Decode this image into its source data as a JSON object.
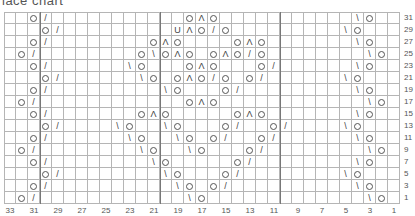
{
  "title": "lace chart",
  "chart_data": {
    "type": "table",
    "title": "lace chart",
    "columns": 33,
    "rows_shown": [
      31,
      29,
      27,
      25,
      23,
      21,
      19,
      17,
      15,
      13,
      11,
      9,
      7,
      5,
      3,
      1
    ],
    "column_labels": [
      "33",
      "31",
      "29",
      "27",
      "25",
      "23",
      "21",
      "19",
      "17",
      "15",
      "13",
      "11",
      "9",
      "7",
      "5",
      "3",
      "1"
    ],
    "row_labels": [
      "31",
      "29",
      "27",
      "25",
      "23",
      "21",
      "19",
      "17",
      "15",
      "13",
      "11",
      "9",
      "7",
      "5",
      "3",
      "1"
    ],
    "legend_symbols": {
      "O": "yarn over",
      "/": "k2tog",
      "\\": "ssk",
      "Λ": "centered double decrease",
      "U": "special stitch"
    },
    "repeat_lines_x": [
      40,
      160,
      280
    ],
    "grid": [
      {
        "row": 31,
        "cells": [
          [
            2,
            "O"
          ],
          [
            3,
            "/"
          ],
          [
            15,
            "O"
          ],
          [
            16,
            "Λ"
          ],
          [
            17,
            "O"
          ],
          [
            29,
            "\\"
          ],
          [
            30,
            "O"
          ]
        ]
      },
      {
        "row": 29,
        "cells": [
          [
            3,
            "O"
          ],
          [
            4,
            "/"
          ],
          [
            14,
            "U"
          ],
          [
            15,
            "Λ"
          ],
          [
            16,
            "O"
          ],
          [
            17,
            "/"
          ],
          [
            18,
            "O"
          ],
          [
            28,
            "\\"
          ],
          [
            29,
            "O"
          ]
        ]
      },
      {
        "row": 27,
        "cells": [
          [
            2,
            "O"
          ],
          [
            3,
            "/"
          ],
          [
            12,
            "O"
          ],
          [
            13,
            "Λ"
          ],
          [
            14,
            "O"
          ],
          [
            19,
            "O"
          ],
          [
            20,
            "Λ"
          ],
          [
            21,
            "O"
          ],
          [
            29,
            "\\"
          ],
          [
            30,
            "O"
          ]
        ]
      },
      {
        "row": 25,
        "cells": [
          [
            1,
            "O"
          ],
          [
            2,
            "/"
          ],
          [
            11,
            "O"
          ],
          [
            12,
            "\\"
          ],
          [
            13,
            "O"
          ],
          [
            14,
            "Λ"
          ],
          [
            15,
            "O"
          ],
          [
            17,
            "O"
          ],
          [
            18,
            "Λ"
          ],
          [
            19,
            "O"
          ],
          [
            20,
            "/"
          ],
          [
            21,
            "O"
          ],
          [
            30,
            "\\"
          ],
          [
            31,
            "O"
          ]
        ]
      },
      {
        "row": 23,
        "cells": [
          [
            2,
            "O"
          ],
          [
            3,
            "/"
          ],
          [
            10,
            "\\"
          ],
          [
            11,
            "O"
          ],
          [
            15,
            "O"
          ],
          [
            16,
            "Λ"
          ],
          [
            17,
            "O"
          ],
          [
            21,
            "O"
          ],
          [
            22,
            "/"
          ],
          [
            29,
            "\\"
          ],
          [
            30,
            "O"
          ]
        ]
      },
      {
        "row": 21,
        "cells": [
          [
            3,
            "O"
          ],
          [
            4,
            "/"
          ],
          [
            11,
            "\\"
          ],
          [
            12,
            "O"
          ],
          [
            14,
            "O"
          ],
          [
            15,
            "Λ"
          ],
          [
            16,
            "O"
          ],
          [
            17,
            "/"
          ],
          [
            18,
            "O"
          ],
          [
            20,
            "O"
          ],
          [
            21,
            "/"
          ],
          [
            28,
            "\\"
          ],
          [
            29,
            "O"
          ]
        ]
      },
      {
        "row": 19,
        "cells": [
          [
            2,
            "O"
          ],
          [
            3,
            "/"
          ],
          [
            13,
            "\\"
          ],
          [
            14,
            "O"
          ],
          [
            18,
            "O"
          ],
          [
            19,
            "/"
          ],
          [
            29,
            "\\"
          ],
          [
            30,
            "O"
          ]
        ]
      },
      {
        "row": 17,
        "cells": [
          [
            1,
            "O"
          ],
          [
            2,
            "/"
          ],
          [
            15,
            "O"
          ],
          [
            16,
            "Λ"
          ],
          [
            17,
            "O"
          ],
          [
            30,
            "\\"
          ],
          [
            31,
            "O"
          ]
        ]
      },
      {
        "row": 15,
        "cells": [
          [
            2,
            "O"
          ],
          [
            3,
            "/"
          ],
          [
            11,
            "O"
          ],
          [
            12,
            "Λ"
          ],
          [
            13,
            "O"
          ],
          [
            19,
            "O"
          ],
          [
            20,
            "Λ"
          ],
          [
            21,
            "O"
          ],
          [
            29,
            "\\"
          ],
          [
            30,
            "O"
          ]
        ]
      },
      {
        "row": 13,
        "cells": [
          [
            3,
            "O"
          ],
          [
            4,
            "/"
          ],
          [
            9,
            "\\"
          ],
          [
            10,
            "O"
          ],
          [
            13,
            "\\"
          ],
          [
            14,
            "O"
          ],
          [
            18,
            "O"
          ],
          [
            19,
            "/"
          ],
          [
            22,
            "O"
          ],
          [
            23,
            "/"
          ],
          [
            28,
            "\\"
          ],
          [
            29,
            "O"
          ]
        ]
      },
      {
        "row": 11,
        "cells": [
          [
            2,
            "O"
          ],
          [
            3,
            "/"
          ],
          [
            10,
            "\\"
          ],
          [
            11,
            "O"
          ],
          [
            14,
            "\\"
          ],
          [
            15,
            "O"
          ],
          [
            17,
            "O"
          ],
          [
            18,
            "/"
          ],
          [
            21,
            "O"
          ],
          [
            22,
            "/"
          ],
          [
            29,
            "\\"
          ],
          [
            30,
            "O"
          ]
        ]
      },
      {
        "row": 9,
        "cells": [
          [
            1,
            "O"
          ],
          [
            2,
            "/"
          ],
          [
            11,
            "\\"
          ],
          [
            12,
            "O"
          ],
          [
            15,
            "\\"
          ],
          [
            16,
            "O"
          ],
          [
            20,
            "O"
          ],
          [
            21,
            "/"
          ],
          [
            30,
            "\\"
          ],
          [
            31,
            "O"
          ]
        ]
      },
      {
        "row": 7,
        "cells": [
          [
            2,
            "O"
          ],
          [
            3,
            "/"
          ],
          [
            12,
            "\\"
          ],
          [
            13,
            "O"
          ],
          [
            19,
            "O"
          ],
          [
            20,
            "/"
          ],
          [
            29,
            "\\"
          ],
          [
            30,
            "O"
          ]
        ]
      },
      {
        "row": 5,
        "cells": [
          [
            3,
            "O"
          ],
          [
            4,
            "/"
          ],
          [
            13,
            "\\"
          ],
          [
            14,
            "O"
          ],
          [
            18,
            "O"
          ],
          [
            19,
            "/"
          ],
          [
            28,
            "\\"
          ],
          [
            29,
            "O"
          ]
        ]
      },
      {
        "row": 3,
        "cells": [
          [
            2,
            "O"
          ],
          [
            3,
            "/"
          ],
          [
            14,
            "\\"
          ],
          [
            15,
            "O"
          ],
          [
            17,
            "O"
          ],
          [
            18,
            "/"
          ],
          [
            29,
            "\\"
          ],
          [
            30,
            "O"
          ]
        ]
      },
      {
        "row": 1,
        "cells": [
          [
            1,
            "O"
          ],
          [
            2,
            "/"
          ],
          [
            15,
            "\\"
          ],
          [
            16,
            "O"
          ],
          [
            30,
            "\\"
          ],
          [
            31,
            "O"
          ]
        ]
      }
    ],
    "note": "cells are [column index from left (0=col 33), symbol]"
  }
}
